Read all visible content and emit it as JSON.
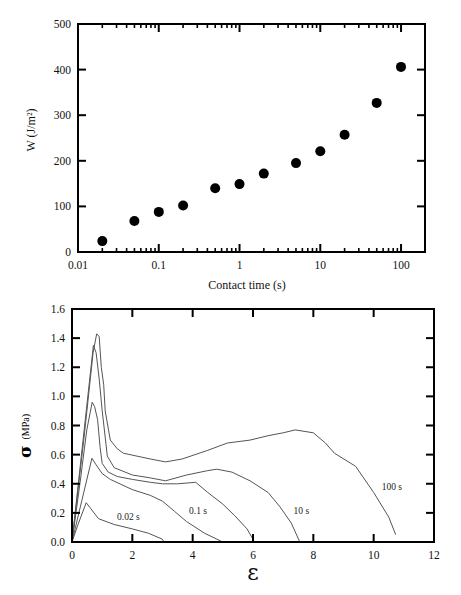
{
  "chart_data": [
    {
      "type": "scatter",
      "title": "",
      "xlabel": "Contact time (s)",
      "ylabel": "W (J/m²)",
      "xscale": "log",
      "xlim": [
        0.01,
        198
      ],
      "ylim": [
        0,
        500
      ],
      "xticks": [
        0.01,
        0.1,
        1,
        10,
        100
      ],
      "xtick_labels": [
        "0.01",
        "0.1",
        "1",
        "10",
        "100"
      ],
      "yticks": [
        0,
        100,
        200,
        300,
        400,
        500
      ],
      "ytick_labels": [
        "0",
        "100",
        "200",
        "300",
        "400",
        "500"
      ],
      "grid": false,
      "legend": null,
      "series": [
        {
          "name": "W",
          "marker": "filled-circle",
          "color": "#000000",
          "x": [
            0.02,
            0.05,
            0.1,
            0.2,
            0.5,
            1,
            2,
            5,
            10,
            20,
            50,
            100
          ],
          "y": [
            24,
            68,
            88,
            102,
            140,
            149,
            172,
            195,
            221,
            257,
            327,
            406
          ]
        }
      ]
    },
    {
      "type": "line",
      "title": "",
      "xlabel": "ε",
      "ylabel": "σ (MPa)",
      "ylabel_symbol": "σ",
      "ylabel_unit": "(MPa)",
      "xscale": "linear",
      "xlim": [
        0,
        12
      ],
      "ylim": [
        0,
        1.6
      ],
      "xticks": [
        0,
        2,
        4,
        6,
        8,
        10,
        12
      ],
      "xtick_labels": [
        "0",
        "2",
        "4",
        "6",
        "8",
        "10",
        "12"
      ],
      "yticks": [
        0,
        0.2,
        0.4,
        0.6,
        0.8,
        1.0,
        1.2,
        1.4,
        1.6
      ],
      "ytick_labels": [
        "0.0",
        "0.2",
        "0.4",
        "0.6",
        "0.8",
        "1.0",
        "1.2",
        "1.4",
        "1.6"
      ],
      "grid": false,
      "legend": null,
      "series": [
        {
          "name": "0.02 s",
          "label": "0.02 s",
          "label_pos": [
            1.87,
            0.17
          ],
          "color": "#555555",
          "points": [
            [
              0,
              0
            ],
            [
              0.2,
              0.12
            ],
            [
              0.47,
              0.27
            ],
            [
              0.62,
              0.23
            ],
            [
              0.88,
              0.16
            ],
            [
              1.4,
              0.12
            ],
            [
              2.0,
              0.09
            ],
            [
              2.54,
              0.06
            ],
            [
              2.99,
              0.02
            ],
            [
              3.05,
              0.0
            ]
          ]
        },
        {
          "name": "0.1 s",
          "label": "0.1 s",
          "label_pos": [
            4.18,
            0.21
          ],
          "color": "#555555",
          "points": [
            [
              0,
              0
            ],
            [
              0.33,
              0.29
            ],
            [
              0.66,
              0.575
            ],
            [
              0.8,
              0.53
            ],
            [
              1.0,
              0.47
            ],
            [
              1.27,
              0.43
            ],
            [
              2.0,
              0.36
            ],
            [
              2.6,
              0.32
            ],
            [
              3.0,
              0.28
            ],
            [
              3.4,
              0.21
            ],
            [
              3.8,
              0.14
            ],
            [
              4.4,
              0.06
            ],
            [
              4.8,
              0.02
            ],
            [
              5.0,
              0.0
            ]
          ]
        },
        {
          "name": "",
          "label": null,
          "label_pos": null,
          "color": "#555555",
          "points": [
            [
              0,
              0
            ],
            [
              0.27,
              0.41
            ],
            [
              0.49,
              0.77
            ],
            [
              0.67,
              0.96
            ],
            [
              0.75,
              0.93
            ],
            [
              0.85,
              0.84
            ],
            [
              0.93,
              0.65
            ],
            [
              1.0,
              0.54
            ],
            [
              1.2,
              0.48
            ],
            [
              1.5,
              0.45
            ],
            [
              2.0,
              0.43
            ],
            [
              2.6,
              0.41
            ],
            [
              3.0,
              0.4
            ],
            [
              3.5,
              0.4
            ],
            [
              4.1,
              0.41
            ],
            [
              4.5,
              0.34
            ],
            [
              5.0,
              0.26
            ],
            [
              5.4,
              0.18
            ],
            [
              5.8,
              0.09
            ],
            [
              6.05,
              0.0
            ]
          ]
        },
        {
          "name": "10 s",
          "label": "10 s",
          "label_pos": [
            7.6,
            0.21
          ],
          "color": "#555555",
          "points": [
            [
              0,
              0
            ],
            [
              0.36,
              0.69
            ],
            [
              0.71,
              1.35
            ],
            [
              0.8,
              1.3
            ],
            [
              0.9,
              1.12
            ],
            [
              1.0,
              0.9
            ],
            [
              1.1,
              0.72
            ],
            [
              1.17,
              0.59
            ],
            [
              1.4,
              0.51
            ],
            [
              2.0,
              0.46
            ],
            [
              2.6,
              0.44
            ],
            [
              3.1,
              0.42
            ],
            [
              3.8,
              0.46
            ],
            [
              4.5,
              0.49
            ],
            [
              4.8,
              0.5
            ],
            [
              5.3,
              0.48
            ],
            [
              5.9,
              0.42
            ],
            [
              6.5,
              0.34
            ],
            [
              6.9,
              0.24
            ],
            [
              7.27,
              0.13
            ],
            [
              7.55,
              0.0
            ]
          ]
        },
        {
          "name": "100 s",
          "label": "100 s",
          "label_pos": [
            10.6,
            0.38
          ],
          "color": "#555555",
          "points": [
            [
              0,
              0
            ],
            [
              0.4,
              0.72
            ],
            [
              0.7,
              1.3
            ],
            [
              0.82,
              1.43
            ],
            [
              0.9,
              1.41
            ],
            [
              0.97,
              1.2
            ],
            [
              1.05,
              1.08
            ],
            [
              1.1,
              0.9
            ],
            [
              1.27,
              0.7
            ],
            [
              1.5,
              0.64
            ],
            [
              1.7,
              0.61
            ],
            [
              2.6,
              0.57
            ],
            [
              3.1,
              0.55
            ],
            [
              3.65,
              0.57
            ],
            [
              4.5,
              0.63
            ],
            [
              5.15,
              0.68
            ],
            [
              5.9,
              0.7
            ],
            [
              6.5,
              0.73
            ],
            [
              7.0,
              0.75
            ],
            [
              7.4,
              0.77
            ],
            [
              8.0,
              0.75
            ],
            [
              8.4,
              0.68
            ],
            [
              8.7,
              0.61
            ],
            [
              9.4,
              0.52
            ],
            [
              10.0,
              0.34
            ],
            [
              10.5,
              0.17
            ],
            [
              10.73,
              0.05
            ]
          ]
        }
      ]
    }
  ]
}
